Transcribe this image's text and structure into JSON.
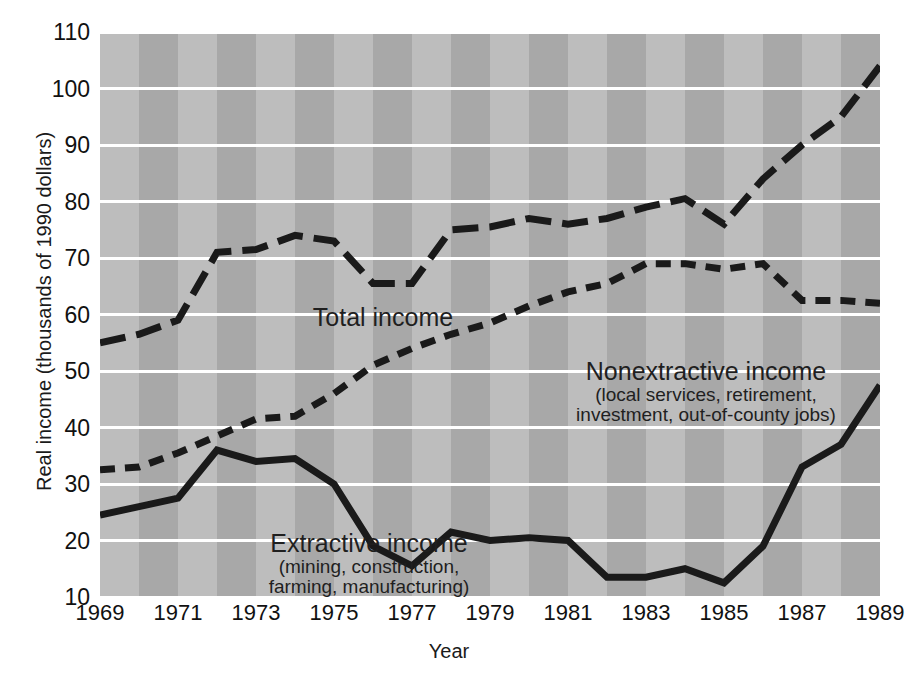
{
  "chart_data": {
    "type": "line",
    "title": "",
    "xlabel": "Year",
    "ylabel": "Real income (thousands of 1990 dollars)",
    "xlim": [
      1969,
      1989
    ],
    "ylim": [
      10,
      110
    ],
    "ytick_step": 10,
    "xtick_step": 2,
    "grid": true,
    "legend_position": "inline-annotations",
    "x": [
      1969,
      1970,
      1971,
      1972,
      1973,
      1974,
      1975,
      1976,
      1977,
      1978,
      1979,
      1980,
      1981,
      1982,
      1983,
      1984,
      1985,
      1986,
      1987,
      1988,
      1989
    ],
    "ytick_labels": [
      "110",
      "100",
      "90",
      "80",
      "70",
      "60",
      "50",
      "40",
      "30",
      "20",
      "10"
    ],
    "xtick_labels": [
      "1969",
      "1971",
      "1973",
      "1975",
      "1977",
      "1979",
      "1981",
      "1983",
      "1985",
      "1987",
      "1989"
    ],
    "series": [
      {
        "name": "Total income",
        "style": "long-dash",
        "color": "#1a1a1a",
        "values": [
          55.0,
          56.5,
          59.0,
          71.0,
          71.5,
          74.0,
          73.0,
          65.5,
          65.5,
          75.0,
          75.5,
          77.0,
          76.0,
          77.0,
          79.0,
          80.5,
          76.0,
          84.0,
          90.0,
          95.0,
          104.0
        ]
      },
      {
        "name": "Nonextractive income",
        "style": "short-dash",
        "color": "#1a1a1a",
        "values": [
          32.5,
          33.0,
          35.5,
          38.5,
          41.5,
          42.0,
          46.0,
          51.0,
          54.0,
          56.5,
          58.5,
          61.5,
          64.0,
          65.5,
          69.0,
          69.0,
          68.0,
          69.0,
          62.5,
          62.5,
          62.0
        ]
      },
      {
        "name": "Extractive income",
        "style": "solid",
        "color": "#1a1a1a",
        "values": [
          24.5,
          26.0,
          27.5,
          36.0,
          34.0,
          34.5,
          30.0,
          19.0,
          15.5,
          21.5,
          20.0,
          20.5,
          20.0,
          13.5,
          13.5,
          15.0,
          12.5,
          19.0,
          33.0,
          37.0,
          47.5
        ]
      }
    ],
    "annotations": [
      {
        "id": "total",
        "line1": "Total income",
        "line2": "",
        "line3": ""
      },
      {
        "id": "nonextractive",
        "line1": "Nonextractive income",
        "line2": "(local services, retirement,",
        "line3": "investment, out-of-county jobs)"
      },
      {
        "id": "extractive",
        "line1": "Extractive income",
        "line2": "(mining, construction,",
        "line3": "farming, manufacturing)"
      }
    ],
    "colors": {
      "plot_background": "#a8a8a8",
      "band_alternate": "#bdbdbd",
      "gridline": "#ffffff",
      "line": "#1a1a1a",
      "text": "#1a1a1a"
    }
  }
}
